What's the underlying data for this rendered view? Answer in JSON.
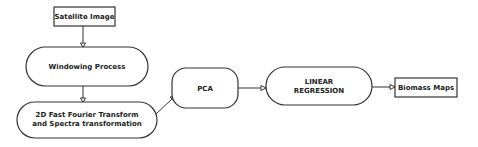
{
  "diagram": {
    "type": "flowchart",
    "nodes": [
      {
        "id": "satellite",
        "label": "Satellite Image",
        "shape": "rectangle"
      },
      {
        "id": "windowing",
        "label": "Windowing Process",
        "shape": "stadium"
      },
      {
        "id": "fft",
        "label_line1": "2D Fast Fourier Transform",
        "label_line2": "and Spectra transformation",
        "shape": "stadium"
      },
      {
        "id": "pca",
        "label": "PCA",
        "shape": "rounded-rectangle"
      },
      {
        "id": "regression",
        "label_line1": "LINEAR",
        "label_line2": "REGRESSION",
        "shape": "stadium"
      },
      {
        "id": "biomass",
        "label": "Biomass Maps",
        "shape": "rectangle"
      }
    ],
    "edges": [
      {
        "from": "satellite",
        "to": "windowing"
      },
      {
        "from": "windowing",
        "to": "fft"
      },
      {
        "from": "fft",
        "to": "pca"
      },
      {
        "from": "pca",
        "to": "regression"
      },
      {
        "from": "regression",
        "to": "biomass"
      }
    ]
  },
  "colors": {
    "stroke": "#333333",
    "fill": "#ffffff",
    "text": "#222222"
  }
}
